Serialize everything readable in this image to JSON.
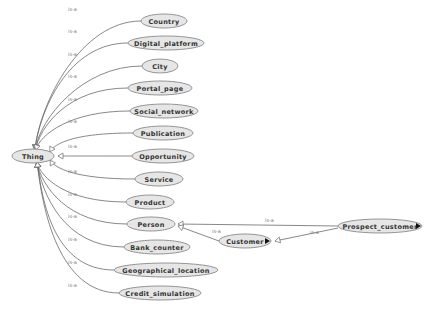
{
  "diagram": {
    "type": "ontology-class-hierarchy",
    "edge_label": "is-a",
    "root": {
      "id": "thing",
      "label": "Thing"
    },
    "nodes": [
      {
        "id": "thing",
        "label": "Thing",
        "cx": 33,
        "cy": 156,
        "rx": 21,
        "ry": 7
      },
      {
        "id": "country",
        "label": "Country",
        "cx": 164,
        "cy": 21,
        "rx": 23,
        "ry": 7
      },
      {
        "id": "digital_platform",
        "label": "Digital_platform",
        "cx": 166,
        "cy": 43,
        "rx": 38,
        "ry": 7
      },
      {
        "id": "city",
        "label": "City",
        "cx": 160,
        "cy": 66,
        "rx": 18,
        "ry": 7
      },
      {
        "id": "portal_page",
        "label": "Portal_page",
        "cx": 160,
        "cy": 88,
        "rx": 32,
        "ry": 7
      },
      {
        "id": "social_network",
        "label": "Social_network",
        "cx": 164,
        "cy": 111,
        "rx": 34,
        "ry": 7
      },
      {
        "id": "publication",
        "label": "Publication",
        "cx": 163,
        "cy": 133,
        "rx": 30,
        "ry": 7
      },
      {
        "id": "opportunity",
        "label": "Opportunity",
        "cx": 163,
        "cy": 156,
        "rx": 31,
        "ry": 7
      },
      {
        "id": "service",
        "label": "Service",
        "cx": 159,
        "cy": 179,
        "rx": 24,
        "ry": 7
      },
      {
        "id": "product",
        "label": "Product",
        "cx": 150,
        "cy": 202,
        "rx": 24,
        "ry": 7
      },
      {
        "id": "person",
        "label": "Person",
        "cx": 151,
        "cy": 224,
        "rx": 24,
        "ry": 7
      },
      {
        "id": "bank_counter",
        "label": "Bank_counter",
        "cx": 157,
        "cy": 247,
        "rx": 33,
        "ry": 7
      },
      {
        "id": "geographical_location",
        "label": "Geographical_location",
        "cx": 166,
        "cy": 270,
        "rx": 52,
        "ry": 7
      },
      {
        "id": "credit_simulation",
        "label": "Credit_simulation",
        "cx": 160,
        "cy": 293,
        "rx": 41,
        "ry": 7
      },
      {
        "id": "customer",
        "label": "Customer",
        "cx": 245,
        "cy": 241,
        "rx": 26,
        "ry": 7
      },
      {
        "id": "prospect_customer",
        "label": "Prospect_customer",
        "cx": 380,
        "cy": 226,
        "rx": 42,
        "ry": 7
      }
    ],
    "edges": [
      {
        "from": "country",
        "to": "thing",
        "label": "is-a"
      },
      {
        "from": "digital_platform",
        "to": "thing",
        "label": "is-a"
      },
      {
        "from": "city",
        "to": "thing",
        "label": "is-a"
      },
      {
        "from": "portal_page",
        "to": "thing",
        "label": "is-a"
      },
      {
        "from": "social_network",
        "to": "thing",
        "label": "is-a"
      },
      {
        "from": "publication",
        "to": "thing",
        "label": "is-a"
      },
      {
        "from": "opportunity",
        "to": "thing",
        "label": "is-a"
      },
      {
        "from": "service",
        "to": "thing",
        "label": "is-a"
      },
      {
        "from": "product",
        "to": "thing",
        "label": "is-a"
      },
      {
        "from": "person",
        "to": "thing",
        "label": "is-a"
      },
      {
        "from": "bank_counter",
        "to": "thing",
        "label": "is-a"
      },
      {
        "from": "geographical_location",
        "to": "thing",
        "label": "is-a"
      },
      {
        "from": "credit_simulation",
        "to": "thing",
        "label": "is-a"
      },
      {
        "from": "prospect_customer",
        "to": "person",
        "label": "is-a"
      },
      {
        "from": "customer",
        "to": "person",
        "label": "is-a"
      },
      {
        "from": "prospect_customer",
        "to": "customer",
        "label": "is-a"
      }
    ]
  }
}
